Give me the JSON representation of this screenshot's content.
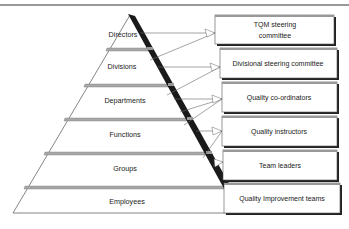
{
  "diagram": {
    "pyramid_levels": [
      {
        "label": "Directors"
      },
      {
        "label": "Divisions"
      },
      {
        "label": "Departments"
      },
      {
        "label": "Functions"
      },
      {
        "label": "Groups"
      },
      {
        "label": "Employees"
      }
    ],
    "quality_roles": [
      {
        "line1": "TQM steering",
        "line2": "committee"
      },
      {
        "line1": "Divisional steering committee",
        "line2": ""
      },
      {
        "line1": "Quality co-ordinators",
        "line2": ""
      },
      {
        "line1": "Quality instructors",
        "line2": ""
      },
      {
        "line1": "Team leaders",
        "line2": ""
      },
      {
        "line1": "Quality Improvement teams",
        "line2": ""
      }
    ],
    "colors": {
      "edge_band": "#1a1a1a",
      "separator": "#9a9a9a",
      "line": "#555555",
      "box_fill": "#ffffff",
      "box_shadow": "#222222",
      "text": "#222222"
    }
  }
}
